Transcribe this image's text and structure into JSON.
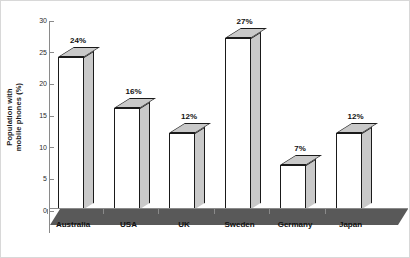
{
  "chart_data": {
    "type": "bar",
    "title": "",
    "subtitle": "",
    "xlabel": "",
    "ylabel": "Population with mobile phones (%)",
    "ylabel_line1": "Population with",
    "ylabel_line2": "mobile phones (%)",
    "categories": [
      "Australia",
      "USA",
      "UK",
      "Sweden",
      "Germany",
      "Japan"
    ],
    "values": [
      24,
      16,
      12,
      27,
      7,
      12
    ],
    "data_labels": [
      "24%",
      "16%",
      "12%",
      "27%",
      "7%",
      "12%"
    ],
    "ylim": [
      0,
      30
    ],
    "ytick_values": [
      0,
      5,
      10,
      15,
      20,
      25,
      30
    ],
    "ytick_labels": [
      "0",
      "5",
      "10",
      "15",
      "20",
      "25",
      "30"
    ],
    "grid": false,
    "legend": false,
    "legend_position": "none",
    "style": "3d-bar",
    "colors": {
      "bar_front": "#ffffff",
      "bar_side": "#c9c9c9",
      "bar_top": "#c9c9c9",
      "bar_outline": "#1a1a1a",
      "ground_plane": "#595959",
      "axis": "#8a8a8a",
      "text": "#111111",
      "background": "#ffffff",
      "frame_border": "#d8d8d8"
    }
  }
}
